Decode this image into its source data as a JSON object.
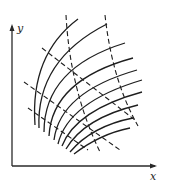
{
  "diagram": {
    "title": "",
    "axes": {
      "x_label": "x",
      "y_label": "y"
    },
    "colors": {
      "ink": "#1e1e1e",
      "background": "#ffffff"
    },
    "arcs": [
      "M35,125 Q30,55 78,19",
      "M39,128 Q36,60 107,24",
      "M44,132 Q44,68 125,43",
      "M49,136 Q52,80 133,58",
      "M54,140 Q60,92 137,70",
      "M58,144 Q68,102 142,80",
      "M62,146 Q76,110 142,92",
      "M66,149 Q84,118 138,105",
      "M70,152 Q92,126 133,118",
      "M74,154 Q100,134 130,128"
    ],
    "dashed_lines": [
      "M66,15 Q70,90 100,152",
      "M105,15 Q112,80 138,126",
      "M24,82 L120,150",
      "M28,108 L88,150",
      "M42,48 L135,120"
    ]
  }
}
